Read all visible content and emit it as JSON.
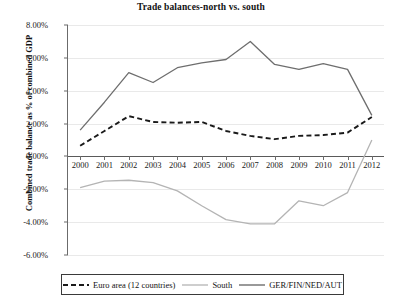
{
  "chart_data": {
    "type": "line",
    "title": "Trade balances-north vs. south",
    "xlabel": "",
    "ylabel": "Combined trade balance as % of combined GDP",
    "x": [
      "2000",
      "2001",
      "2002",
      "2003",
      "2004",
      "2005",
      "2006",
      "2007",
      "2008",
      "2009",
      "2010",
      "2011",
      "2012"
    ],
    "categories": [
      "2000",
      "2001",
      "2002",
      "2003",
      "2004",
      "2005",
      "2006",
      "2007",
      "2008",
      "2009",
      "2010",
      "2011",
      "2012"
    ],
    "ylim": [
      -6.0,
      8.0
    ],
    "ytick_labels": [
      "8.00%",
      "6.00%",
      "4.00%",
      "2.00%",
      "0.00%",
      "-2.00%",
      "-4.00%",
      "-6.00%"
    ],
    "ytick_values": [
      8.0,
      6.0,
      4.0,
      2.0,
      0.0,
      -2.0,
      -4.0,
      -6.0
    ],
    "grid": true,
    "legend_position": "bottom",
    "units": "percent of combined GDP",
    "series": [
      {
        "name": "Euro area (12 countries)",
        "style": "dashed",
        "color": "#1a1a1a",
        "values": [
          0.65,
          1.55,
          2.45,
          2.1,
          2.05,
          2.1,
          1.55,
          1.25,
          1.05,
          1.25,
          1.3,
          1.45,
          2.4
        ]
      },
      {
        "name": "South",
        "style": "solid",
        "color": "#b4b4b4",
        "values": [
          -1.9,
          -1.5,
          -1.45,
          -1.6,
          -2.1,
          -3.0,
          -3.85,
          -4.1,
          -4.1,
          -2.7,
          -3.0,
          -2.2,
          1.0
        ]
      },
      {
        "name": "GER/FIN/NED/AUT",
        "style": "solid",
        "color": "#6e6e6e",
        "values": [
          1.6,
          3.3,
          5.1,
          4.5,
          5.4,
          5.7,
          5.9,
          7.0,
          5.6,
          5.3,
          5.65,
          5.3,
          2.5
        ]
      }
    ]
  },
  "legend": {
    "items": [
      {
        "label": "Euro area (12 countries)"
      },
      {
        "label": "South"
      },
      {
        "label": "GER/FIN/NED/AUT"
      }
    ]
  }
}
